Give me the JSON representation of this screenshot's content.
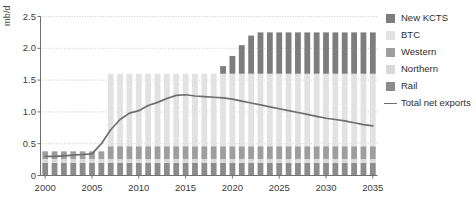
{
  "chart_data": {
    "type": "bar",
    "stacked": true,
    "title": "",
    "xlabel": "",
    "ylabel": "mb/d",
    "ylim": [
      0,
      2.5
    ],
    "yticks": [
      0,
      0.5,
      1.0,
      1.5,
      2.0,
      2.5
    ],
    "ytick_labels": [
      "0",
      "0.5",
      "1.0",
      "1.5",
      "2.0",
      "2.5"
    ],
    "xlim": [
      2000,
      2035
    ],
    "xticks": [
      2000,
      2005,
      2010,
      2015,
      2020,
      2025,
      2030,
      2035
    ],
    "xtick_labels": [
      "2000",
      "2005",
      "2010",
      "2015",
      "2020",
      "2025",
      "2030",
      "2035"
    ],
    "grid": "horizontal-dotted",
    "legend_position": "right",
    "categories": [
      2000,
      2001,
      2002,
      2003,
      2004,
      2005,
      2006,
      2007,
      2008,
      2009,
      2010,
      2011,
      2012,
      2013,
      2014,
      2015,
      2016,
      2017,
      2018,
      2019,
      2020,
      2021,
      2022,
      2023,
      2024,
      2025,
      2026,
      2027,
      2028,
      2029,
      2030,
      2031,
      2032,
      2033,
      2034,
      2035
    ],
    "series": [
      {
        "name": "Rail",
        "color": "#8c8c8c",
        "values": [
          0.2,
          0.2,
          0.2,
          0.2,
          0.2,
          0.2,
          0.2,
          0.2,
          0.2,
          0.2,
          0.2,
          0.2,
          0.2,
          0.2,
          0.2,
          0.2,
          0.2,
          0.2,
          0.2,
          0.2,
          0.2,
          0.2,
          0.2,
          0.2,
          0.2,
          0.2,
          0.2,
          0.2,
          0.2,
          0.2,
          0.2,
          0.2,
          0.2,
          0.2,
          0.2,
          0.2
        ]
      },
      {
        "name": "Northern",
        "color": "#d8d8d8",
        "values": [
          0.06,
          0.06,
          0.06,
          0.06,
          0.06,
          0.06,
          0.06,
          0.06,
          0.06,
          0.06,
          0.06,
          0.06,
          0.06,
          0.06,
          0.06,
          0.06,
          0.06,
          0.06,
          0.06,
          0.06,
          0.06,
          0.06,
          0.06,
          0.06,
          0.06,
          0.06,
          0.06,
          0.06,
          0.06,
          0.06,
          0.06,
          0.06,
          0.06,
          0.06,
          0.06,
          0.06
        ]
      },
      {
        "name": "Western",
        "color": "#9e9e9e",
        "values": [
          0.12,
          0.12,
          0.12,
          0.12,
          0.12,
          0.12,
          0.12,
          0.2,
          0.2,
          0.2,
          0.2,
          0.2,
          0.2,
          0.2,
          0.2,
          0.2,
          0.2,
          0.2,
          0.2,
          0.2,
          0.2,
          0.2,
          0.2,
          0.2,
          0.2,
          0.2,
          0.2,
          0.2,
          0.2,
          0.2,
          0.2,
          0.2,
          0.2,
          0.2,
          0.2,
          0.2
        ]
      },
      {
        "name": "BTC",
        "color": "#e2e2e2",
        "values": [
          0.0,
          0.0,
          0.0,
          0.0,
          0.0,
          0.0,
          0.0,
          1.14,
          1.14,
          1.14,
          1.14,
          1.14,
          1.14,
          1.14,
          1.14,
          1.14,
          1.14,
          1.14,
          1.14,
          1.14,
          1.14,
          1.14,
          1.14,
          1.14,
          1.14,
          1.14,
          1.14,
          1.14,
          1.14,
          1.14,
          1.14,
          1.14,
          1.14,
          1.14,
          1.14,
          1.14
        ]
      },
      {
        "name": "New KCTS",
        "color": "#7d7d7d",
        "values": [
          0.0,
          0.0,
          0.0,
          0.0,
          0.0,
          0.0,
          0.0,
          0.0,
          0.0,
          0.0,
          0.0,
          0.0,
          0.0,
          0.0,
          0.0,
          0.0,
          0.0,
          0.0,
          0.0,
          0.12,
          0.28,
          0.45,
          0.6,
          0.65,
          0.65,
          0.65,
          0.65,
          0.65,
          0.65,
          0.65,
          0.65,
          0.65,
          0.65,
          0.65,
          0.65,
          0.65
        ]
      }
    ],
    "line_series": {
      "name": "Total net exports",
      "color": "#6e6e6e",
      "values": [
        0.3,
        0.3,
        0.31,
        0.32,
        0.33,
        0.34,
        0.5,
        0.72,
        0.88,
        0.98,
        1.02,
        1.1,
        1.15,
        1.21,
        1.26,
        1.27,
        1.25,
        1.24,
        1.23,
        1.22,
        1.2,
        1.17,
        1.14,
        1.11,
        1.08,
        1.05,
        1.02,
        0.99,
        0.96,
        0.93,
        0.9,
        0.88,
        0.86,
        0.83,
        0.8,
        0.78
      ]
    }
  },
  "legend": {
    "items": [
      {
        "label": "New KCTS",
        "type": "swatch",
        "color": "#7d7d7d"
      },
      {
        "label": "BTC",
        "type": "swatch",
        "color": "#e2e2e2"
      },
      {
        "label": "Western",
        "type": "swatch",
        "color": "#9e9e9e"
      },
      {
        "label": "Northern",
        "type": "swatch",
        "color": "#d8d8d8"
      },
      {
        "label": "Rail",
        "type": "swatch",
        "color": "#8c8c8c"
      },
      {
        "label": "Total net exports",
        "type": "line",
        "color": "#6e6e6e"
      }
    ]
  }
}
